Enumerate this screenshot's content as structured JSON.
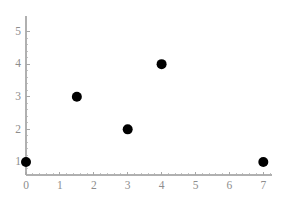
{
  "chart_data": {
    "type": "scatter",
    "title": "",
    "subtitle": "",
    "xlabel": "",
    "ylabel": "",
    "xlim": [
      0,
      7.2
    ],
    "ylim": [
      0.6,
      5.0
    ],
    "grid": false,
    "legend": null,
    "x_ticks": [
      0,
      1,
      2,
      3,
      4,
      5,
      6,
      7
    ],
    "x_tick_labels": [
      "0",
      "1",
      "2",
      "3",
      "4",
      "5",
      "6",
      "7"
    ],
    "y_ticks": [
      1,
      2,
      3,
      4,
      5
    ],
    "y_tick_labels": [
      "1",
      "2",
      "3",
      "4",
      "5"
    ],
    "x_minor_tick_count": 4,
    "y_minor_tick_count": 4,
    "marker": "circle",
    "marker_color": "#000000",
    "marker_size_px": 10,
    "axis_color": "#b0b0b0",
    "tick_label_color": "#8d8d8d",
    "background_color": "#ffffff",
    "points": [
      {
        "x": 0,
        "y": 1
      },
      {
        "x": 1.5,
        "y": 3
      },
      {
        "x": 3,
        "y": 2
      },
      {
        "x": 4,
        "y": 4
      },
      {
        "x": 7,
        "y": 1
      }
    ],
    "x": [
      0,
      1.5,
      3,
      4,
      7
    ],
    "values": [
      1,
      3,
      2,
      4,
      1
    ]
  },
  "layout": {
    "width": 291,
    "height": 206,
    "plot_origin_x": 26,
    "plot_origin_y": 175,
    "px_per_x_unit": 33.9,
    "px_per_y_unit": 32.6,
    "y_axis_top": 16,
    "x_axis_right": 272
  }
}
